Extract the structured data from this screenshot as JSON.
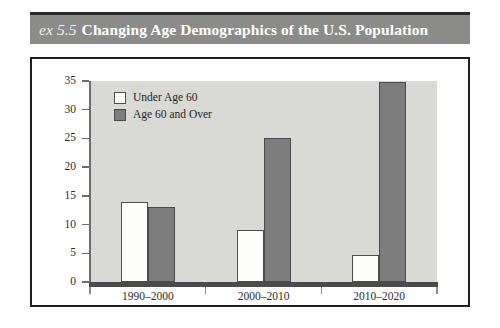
{
  "exhibit": {
    "number_label": "ex 5.5",
    "title": "Changing Age Demographics of the U.S. Population"
  },
  "legend": {
    "position": "top-left-inside-plot",
    "entries": [
      {
        "label": "Under Age 60",
        "color": "#fdfdfb"
      },
      {
        "label": "Age 60 and Over",
        "color": "#7d7d7d"
      }
    ]
  },
  "axes": {
    "y_ticks": [
      "35",
      "30",
      "25",
      "20",
      "15",
      "10",
      "5",
      "0"
    ],
    "x_ticks": [
      "1990–2000",
      "2000–2010",
      "2010–2020"
    ]
  },
  "colors": {
    "header_bar": "#8b8b8a",
    "header_text": "#ffffff",
    "plot_background": "#d9d9d5",
    "frame": "#231f20",
    "bar_under": "#fdfdfb",
    "bar_over": "#7d7d7d",
    "axis_line": "#6d6d6d",
    "baseline": "#4a4a4a"
  },
  "chart_data": {
    "type": "bar",
    "title": "Changing Age Demographics of the U.S. Population",
    "xlabel": "",
    "ylabel": "",
    "ylim": [
      0,
      35
    ],
    "ytick_interval": 5,
    "grid": false,
    "legend_position": "upper left",
    "categories": [
      "1990–2000",
      "2000–2010",
      "2010–2020"
    ],
    "series": [
      {
        "name": "Under Age 60",
        "values": [
          14,
          9,
          4.7
        ]
      },
      {
        "name": "Age 60 and Over",
        "values": [
          13,
          25,
          34.8
        ]
      }
    ]
  }
}
